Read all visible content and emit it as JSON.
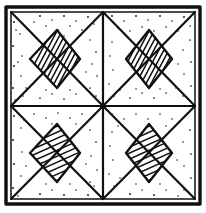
{
  "figure": {
    "title": "Geometric tile pattern",
    "style": "ink line drawing",
    "background_color": "#ffffff",
    "ink_color": "#101010"
  },
  "canvas": {
    "width": 206,
    "height": 213
  },
  "frame": {
    "name": "outer-square-border",
    "left": 6,
    "top": 7,
    "right": 200,
    "bottom": 204,
    "stroke_width": 3.4,
    "inner_offset": 5
  },
  "grid": {
    "center_x": 103,
    "center_y": 106,
    "columns": 2,
    "rows": 2,
    "quadrant_count": 4
  },
  "quadrants": [
    {
      "name": "top-left",
      "x0": 11,
      "y0": 12,
      "x1": 103,
      "y1": 106,
      "hatch_angle_deg": 62,
      "hatch_spacing": 5,
      "diamond_fill": "hatched",
      "stippled": true
    },
    {
      "name": "top-right",
      "x0": 103,
      "y0": 12,
      "x1": 195,
      "y1": 106,
      "hatch_angle_deg": 62,
      "hatch_spacing": 5,
      "diamond_fill": "hatched",
      "stippled": true
    },
    {
      "name": "bottom-left",
      "x0": 11,
      "y0": 106,
      "x1": 103,
      "y1": 199,
      "hatch_angle_deg": 24,
      "hatch_spacing": 5,
      "diamond_fill": "hatched",
      "stippled": true
    },
    {
      "name": "bottom-right",
      "x0": 103,
      "y0": 106,
      "x1": 195,
      "y1": 199,
      "hatch_angle_deg": 24,
      "hatch_spacing": 5,
      "diamond_fill": "hatched",
      "stippled": true
    }
  ],
  "diamond": {
    "name": "inscribed-diamond",
    "inset_ratio": 0.3,
    "vertex_count": 4
  },
  "stipple": {
    "name": "dot-texture",
    "dot_radius": 0.85,
    "region": "outer-triangles-and-margins"
  }
}
